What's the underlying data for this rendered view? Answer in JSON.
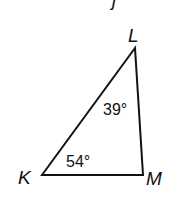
{
  "diagram": {
    "type": "triangle",
    "partial_label_top": "j",
    "vertices": [
      {
        "name": "K",
        "x": 42,
        "y": 175
      },
      {
        "name": "L",
        "x": 135,
        "y": 48
      },
      {
        "name": "M",
        "x": 143,
        "y": 175
      }
    ],
    "angles": [
      {
        "vertex": "L",
        "label": "39°"
      },
      {
        "vertex": "K",
        "label": "54°"
      }
    ],
    "stroke_color": "#111111"
  }
}
